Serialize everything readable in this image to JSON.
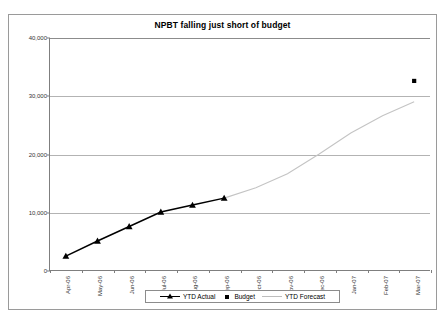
{
  "chart_data": {
    "type": "line",
    "title": "NPBT falling just short of budget",
    "xlabel": "",
    "ylabel": "",
    "ylim": [
      0,
      40000
    ],
    "yticks": [
      0,
      10000,
      20000,
      30000,
      40000
    ],
    "ytick_labels": [
      "0",
      "10,000",
      "20,000",
      "30,000",
      "40,000"
    ],
    "grid": true,
    "legend_position": "bottom",
    "categories": [
      "Apr-06",
      "May-06",
      "Jun-06",
      "Jul-06",
      "Aug-06",
      "Sep-06",
      "Oct-06",
      "Nov-06",
      "Dec-06",
      "Jan-07",
      "Feb-07",
      "Mar-07"
    ],
    "series": [
      {
        "name": "YTD Actual",
        "type": "line",
        "marker": "triangle",
        "color": "#000000",
        "values": [
          2400,
          5000,
          7500,
          10000,
          11200,
          12400,
          null,
          null,
          null,
          null,
          null,
          null
        ]
      },
      {
        "name": "Budget",
        "type": "scatter",
        "marker": "square",
        "color": "#000000",
        "values": [
          null,
          null,
          null,
          null,
          null,
          null,
          null,
          null,
          null,
          null,
          null,
          32600
        ]
      },
      {
        "name": "YTD Forecast",
        "type": "line",
        "marker": "none",
        "color": "#c0c0c0",
        "values": [
          null,
          null,
          null,
          null,
          null,
          12400,
          14200,
          16600,
          20000,
          23600,
          26600,
          29000
        ]
      }
    ]
  },
  "legend": {
    "items": [
      {
        "label": "YTD Actual",
        "key": "line-triangle-marker"
      },
      {
        "label": "Budget",
        "key": "square-marker"
      },
      {
        "label": "YTD Forecast",
        "key": "light-line"
      }
    ]
  }
}
